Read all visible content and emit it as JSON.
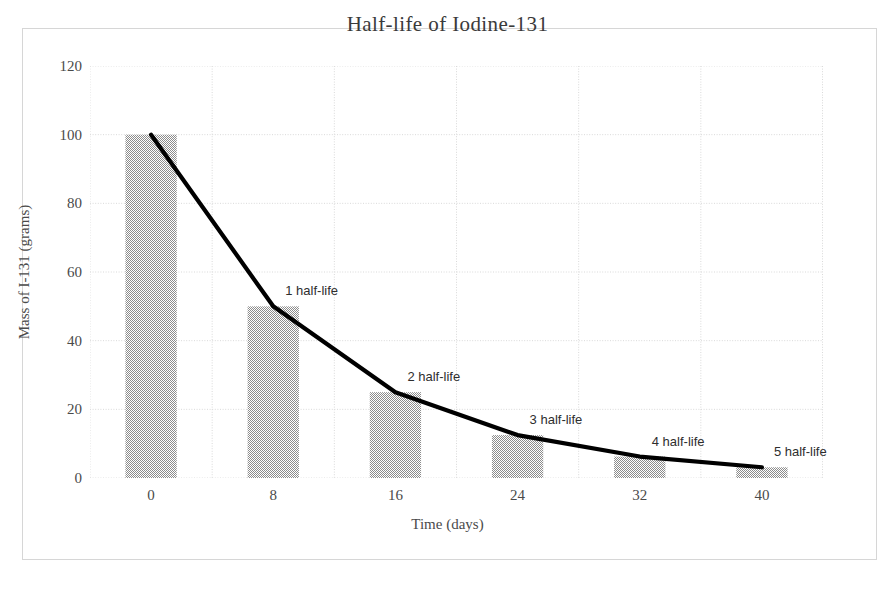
{
  "chart_data": {
    "type": "bar",
    "title": "Half-life of Iodine-131",
    "xlabel": "Time (days)",
    "ylabel": "Mass of I-131 (grams)",
    "categories": [
      "0",
      "8",
      "16",
      "24",
      "32",
      "40"
    ],
    "x": [
      0,
      8,
      16,
      24,
      32,
      40
    ],
    "values": [
      100,
      50,
      25,
      12.5,
      6.25,
      3.125
    ],
    "ylim": [
      0,
      120
    ],
    "xlim": [
      0,
      40
    ],
    "y_ticks": [
      0,
      20,
      40,
      60,
      80,
      100,
      120
    ],
    "y_tick_labels": [
      "0",
      "20",
      "40",
      "60",
      "80",
      "100",
      "120"
    ],
    "x_tick_labels": [
      "0",
      "8",
      "16",
      "24",
      "32",
      "40"
    ],
    "grid": true,
    "legend": "none",
    "series": [
      {
        "name": "Mass of I-131",
        "type": "bar",
        "values": [
          100,
          50,
          25,
          12.5,
          6.25,
          3.125
        ],
        "color": "#9a9a9a"
      },
      {
        "name": "Decay curve",
        "type": "line",
        "values": [
          100,
          50,
          25,
          12.5,
          6.25,
          3.125
        ],
        "color": "#000000"
      }
    ],
    "annotations": [
      {
        "label": "1 half-life",
        "x": 8,
        "y": 50
      },
      {
        "label": "2 half-life",
        "x": 16,
        "y": 25
      },
      {
        "label": "3 half-life",
        "x": 24,
        "y": 12.5
      },
      {
        "label": "4 half-life",
        "x": 32,
        "y": 6.25
      },
      {
        "label": "5 half-life",
        "x": 40,
        "y": 3.125
      }
    ],
    "colors": {
      "bar_fill": "#9a9a9a",
      "line": "#000000",
      "grid": "#d9d9d9",
      "frame": "#d6d6d6",
      "text": "#4a4a4a",
      "background": "#ffffff"
    }
  }
}
